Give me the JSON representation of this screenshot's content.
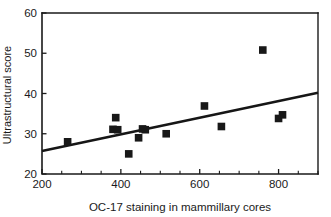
{
  "chart_data": {
    "type": "scatter",
    "title": "",
    "xlabel": "OC-17 staining in mammillary cores",
    "ylabel": "Ultrastructural score",
    "xlim": [
      200,
      900
    ],
    "ylim": [
      20,
      60
    ],
    "grid": false,
    "legend": "none",
    "x_ticks_major": [
      200,
      400,
      600,
      800
    ],
    "x_ticks_major_labels": [
      "200",
      "400",
      "600",
      "800"
    ],
    "x_tick_minor_step": 50,
    "y_ticks_major": [
      20,
      30,
      40,
      50,
      60
    ],
    "y_ticks_major_labels": [
      "20",
      "30",
      "40",
      "50",
      "60"
    ],
    "marker_style": "filled-square",
    "marker_color": "#181818",
    "series": [
      {
        "name": "samples",
        "points": [
          {
            "x": 265,
            "y": 28.0
          },
          {
            "x": 380,
            "y": 31.1
          },
          {
            "x": 387,
            "y": 34.0
          },
          {
            "x": 392,
            "y": 31.0
          },
          {
            "x": 420,
            "y": 25.0
          },
          {
            "x": 445,
            "y": 29.0
          },
          {
            "x": 455,
            "y": 31.2
          },
          {
            "x": 462,
            "y": 31.0
          },
          {
            "x": 515,
            "y": 30.0
          },
          {
            "x": 612,
            "y": 36.9
          },
          {
            "x": 655,
            "y": 31.8
          },
          {
            "x": 760,
            "y": 50.8
          },
          {
            "x": 800,
            "y": 33.8
          },
          {
            "x": 810,
            "y": 34.7
          }
        ]
      }
    ],
    "trend_line": {
      "name": "regression-line",
      "color": "#161616",
      "x_start": 200,
      "y_start": 25.7,
      "x_end": 900,
      "y_end": 40.2
    }
  },
  "axis_labels": {
    "x_title": "OC-17 staining in mammillary cores",
    "y_title": "Ultrastructural score"
  }
}
